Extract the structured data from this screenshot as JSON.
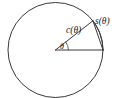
{
  "figure": {
    "type": "geometry-diagram",
    "background_color": "#ffffff",
    "stroke_color": "#3a3a3a",
    "label_color": "#1d1d1d",
    "labels": {
      "arc_label": "s(θ)",
      "chord_label": "c(θ)",
      "angle_label": "θ"
    },
    "geometry": {
      "center_x": 55.5,
      "center_y": 50,
      "radius": 47.5,
      "angle_degrees": 38,
      "horizontal_radius_endpoint_x": 103,
      "horizontal_radius_endpoint_y": 50,
      "angled_radius_endpoint_x": 92.9,
      "angled_radius_endpoint_y": 20.8,
      "angle_arc_radius": 13
    }
  }
}
